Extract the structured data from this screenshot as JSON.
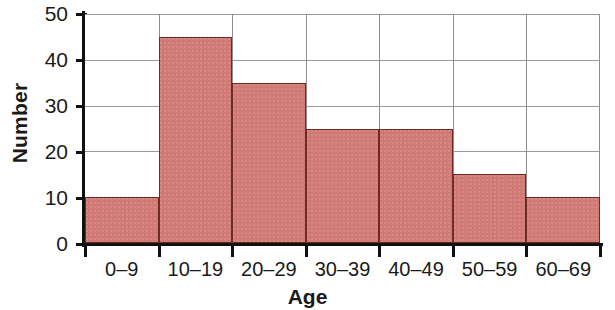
{
  "chart_data": {
    "type": "bar",
    "title": "",
    "subtitle": "",
    "xlabel": "Age",
    "ylabel": "Number",
    "categories": [
      "0–9",
      "10–19",
      "20–29",
      "30–39",
      "40–49",
      "50–59",
      "60–69"
    ],
    "values": [
      10,
      45,
      35,
      25,
      25,
      15,
      10
    ],
    "series": [
      {
        "name": "Number",
        "values": [
          10,
          45,
          35,
          25,
          25,
          15,
          10
        ]
      }
    ],
    "ylim": [
      0,
      50
    ],
    "ytick_labels": [
      "0",
      "10",
      "20",
      "30",
      "40",
      "50"
    ],
    "ytick_values": [
      0,
      10,
      20,
      30,
      40,
      50
    ],
    "ytick_step": 10,
    "grid": "horizontal-and-vertical",
    "legend": "none",
    "legend_position": "none",
    "annotations": [],
    "bar_gap": 0,
    "colors": {
      "bar_fill": "#d17a76",
      "bar_border": "#6e2a26",
      "axis": "#111111",
      "gridline": "#9a9a9a",
      "plot_border": "#8d8d8d",
      "background": "#ffffff",
      "text": "#1a1a1a"
    }
  }
}
